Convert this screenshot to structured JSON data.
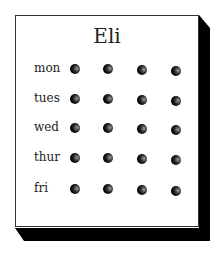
{
  "board": {
    "title": "Eli",
    "rows": [
      {
        "label": "mon",
        "pegs": 4
      },
      {
        "label": "tues",
        "pegs": 4
      },
      {
        "label": "wed",
        "pegs": 4
      },
      {
        "label": "thur",
        "pegs": 4
      },
      {
        "label": "fri",
        "pegs": 4
      }
    ],
    "colors": {
      "face": "#ffffff",
      "edge": "#000000",
      "peg": "#000000",
      "text": "#222222"
    }
  }
}
